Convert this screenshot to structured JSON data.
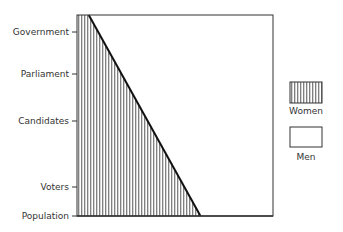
{
  "chart_data": {
    "type": "area",
    "title": "",
    "xlabel": "",
    "ylabel": "",
    "categories": [
      "Government",
      "Parliament",
      "Candidates",
      "Voters",
      "Population"
    ],
    "series": [
      {
        "name": "Women",
        "values": [
          10,
          22,
          36,
          55,
          63
        ],
        "fill": "vertical-hatch"
      },
      {
        "name": "Men",
        "values": [
          90,
          78,
          64,
          45,
          37
        ],
        "fill": "white"
      }
    ],
    "line_endpoints": {
      "top_women_share": 6,
      "bottom_women_share": 63
    },
    "xlim": [
      0,
      100
    ],
    "units": "percent share",
    "grid": false,
    "legend": {
      "placement": "right",
      "entries": [
        "Women",
        "Men"
      ]
    },
    "colors": {
      "stroke": "#222222",
      "hatch": "#555555",
      "background": "#ffffff"
    }
  }
}
